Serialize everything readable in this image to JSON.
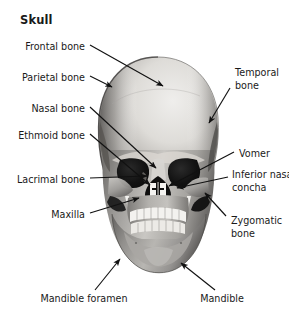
{
  "figure": {
    "title": "Skull",
    "background_color": "#ffffff",
    "text_color": "#1a1a1a",
    "width": 289,
    "height": 319
  },
  "labels": {
    "left": [
      {
        "id": "frontal-bone",
        "text": "Frontal bone",
        "x": 85,
        "y": 48,
        "align": "right"
      },
      {
        "id": "parietal-bone",
        "text": "Parietal bone",
        "x": 85,
        "y": 79,
        "align": "right"
      },
      {
        "id": "nasal-bone",
        "text": "Nasal bone",
        "x": 85,
        "y": 110,
        "align": "right"
      },
      {
        "id": "ethmoid-bone",
        "text": "Ethmoid bone",
        "x": 85,
        "y": 137,
        "align": "right"
      },
      {
        "id": "lacrimal-bone",
        "text": "Lacrimal bone",
        "x": 85,
        "y": 181,
        "align": "right"
      },
      {
        "id": "maxilla",
        "text": "Maxilla",
        "x": 85,
        "y": 216,
        "align": "right"
      }
    ],
    "right": [
      {
        "id": "temporal-bone",
        "text": "Temporal\nbone",
        "x": 235,
        "y": 74,
        "align": "left"
      },
      {
        "id": "vomer",
        "text": "Vomer",
        "x": 239,
        "y": 155,
        "align": "left"
      },
      {
        "id": "inferior-nasal-concha",
        "text": "Inferior nasal\nconcha",
        "x": 232,
        "y": 176,
        "align": "left"
      },
      {
        "id": "zygomatic-bone",
        "text": "Zygomatic\nbone",
        "x": 231,
        "y": 222,
        "align": "left"
      }
    ],
    "bottom": [
      {
        "id": "mandible-foramen",
        "text": "Mandible foramen",
        "x": 84,
        "y": 300,
        "align": "center"
      },
      {
        "id": "mandible",
        "text": "Mandible",
        "x": 222,
        "y": 300,
        "align": "center"
      }
    ]
  },
  "leader_lines": [
    {
      "id": "leader-frontal-bone",
      "from": [
        90,
        45
      ],
      "to": [
        163,
        86
      ],
      "arrow": true
    },
    {
      "id": "leader-parietal-bone",
      "from": [
        90,
        76
      ],
      "to": [
        114,
        86
      ],
      "arrow": true
    },
    {
      "id": "leader-nasal-bone",
      "from": [
        90,
        107
      ],
      "to": [
        156,
        168
      ],
      "arrow": true
    },
    {
      "id": "leader-ethmoid-bone",
      "from": [
        90,
        134
      ],
      "to": [
        149,
        184
      ],
      "arrow": true
    },
    {
      "id": "leader-lacrimal-bone",
      "from": [
        90,
        178
      ],
      "to": [
        148,
        176
      ],
      "arrow": true
    },
    {
      "id": "leader-maxilla",
      "from": [
        90,
        213
      ],
      "to": [
        139,
        198
      ],
      "arrow": true
    },
    {
      "id": "leader-temporal-bone",
      "from": [
        230,
        86
      ],
      "to": [
        209,
        122
      ],
      "arrow": true
    },
    {
      "id": "leader-vomer",
      "from": [
        234,
        152
      ],
      "to": [
        168,
        185
      ],
      "arrow": true
    },
    {
      "id": "leader-inferior-nasal-concha",
      "from": [
        228,
        176
      ],
      "to": [
        176,
        187
      ],
      "arrow": true
    },
    {
      "id": "leader-zygomatic-bone",
      "from": [
        226,
        216
      ],
      "to": [
        204,
        192
      ],
      "arrow": true
    },
    {
      "id": "leader-mandible-foramen",
      "from": [
        95,
        292
      ],
      "to": [
        119,
        258
      ],
      "arrow": true
    },
    {
      "id": "leader-mandible",
      "from": [
        215,
        292
      ],
      "to": [
        180,
        262
      ],
      "arrow": true
    }
  ],
  "illustration_colors": {
    "cranium_light": "#e2e0dd",
    "cranium_mid": "#b9b6b2",
    "cranium_shadow": "#6f6d6b",
    "face_mid": "#9c9a97",
    "face_light": "#cfcdc9",
    "orbit_dark": "#141414",
    "nasal_dark": "#111111",
    "teeth_white": "#f5f4f1",
    "jaw_mid": "#8e8c89",
    "outline": "#3a3a3a"
  }
}
